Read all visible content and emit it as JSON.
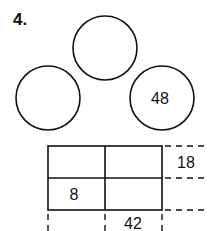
{
  "problem": {
    "number": "4."
  },
  "circles": {
    "top": "",
    "left": "",
    "right": "48"
  },
  "grid": {
    "cells": [
      [
        "",
        ""
      ],
      [
        "8",
        ""
      ]
    ],
    "row_labels": [
      "18",
      ""
    ],
    "column_labels": [
      "",
      "42"
    ]
  }
}
